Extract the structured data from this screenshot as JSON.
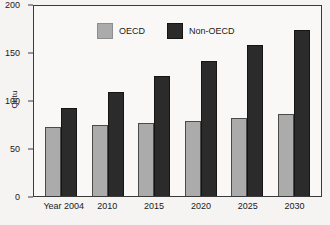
{
  "chart_data": {
    "type": "bar",
    "title": "",
    "subtitle": "",
    "xlabel": "",
    "ylabel": "Qbtu",
    "categories": [
      "Year 2004",
      "2010",
      "2015",
      "2020",
      "2025",
      "2030"
    ],
    "series": [
      {
        "name": "OECD",
        "color": "#ababab",
        "values": [
          72,
          74,
          76,
          78,
          81,
          85
        ]
      },
      {
        "name": "Non-OECD",
        "color": "#2b2b2b",
        "values": [
          92,
          108,
          125,
          141,
          157,
          173
        ]
      }
    ],
    "ylim": [
      0,
      200
    ],
    "yticks": [
      0,
      50,
      100,
      150,
      200
    ],
    "yticklabels": [
      "0",
      "50",
      "100",
      "150",
      "200"
    ],
    "grid": false,
    "legend_position": "top-inside-left",
    "legend_entries": [
      "OECD",
      "Non-OECD"
    ],
    "annotations": []
  },
  "axis": {
    "y_title": "Qbtu",
    "y_labels": [
      "200",
      "150",
      "100",
      "50",
      "0"
    ],
    "x_labels": [
      "Year 2004",
      "2010",
      "2015",
      "2020",
      "2025",
      "2030"
    ]
  },
  "legend": {
    "items": [
      {
        "label": "OECD",
        "swatch": "gray-swatch"
      },
      {
        "label": "Non-OECD",
        "swatch": "dark-swatch"
      }
    ]
  },
  "colors": {
    "oecd": "#ababab",
    "non_oecd": "#2b2b2b",
    "axis": "#3a3a3a",
    "background": "#f5f4f2",
    "plot_background": "#f9f8f6"
  }
}
